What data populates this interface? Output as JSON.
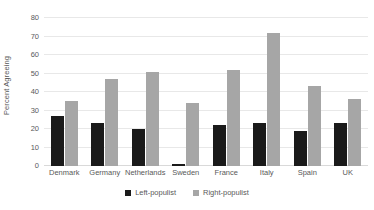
{
  "chart_data": {
    "type": "bar",
    "title": "",
    "subtitle": "",
    "xlabel": "",
    "ylabel": "Percent Agreeing",
    "ylim": [
      0,
      80
    ],
    "yticks": [
      0,
      10,
      20,
      30,
      40,
      50,
      60,
      70,
      80
    ],
    "ytick_labels": [
      "0",
      "10",
      "20",
      "30",
      "40",
      "50",
      "60",
      "70",
      "80"
    ],
    "grid": true,
    "legend_position": "bottom",
    "categories": [
      "Denmark",
      "Germany",
      "Netherlands",
      "Sweden",
      "France",
      "Italy",
      "Spain",
      "UK"
    ],
    "series": [
      {
        "name": "Left-populist",
        "color": "#1a1a1a",
        "values": [
          27,
          23,
          20,
          1,
          22,
          23,
          19,
          23
        ]
      },
      {
        "name": "Right-populist",
        "color": "#a6a6a6",
        "values": [
          35,
          47,
          51,
          34,
          52,
          72,
          43,
          36
        ]
      }
    ]
  },
  "colors": {
    "left_populist": "#1a1a1a",
    "right_populist": "#a6a6a6",
    "gridline": "#e8e8e8",
    "text": "#595959",
    "background": "#ffffff"
  }
}
